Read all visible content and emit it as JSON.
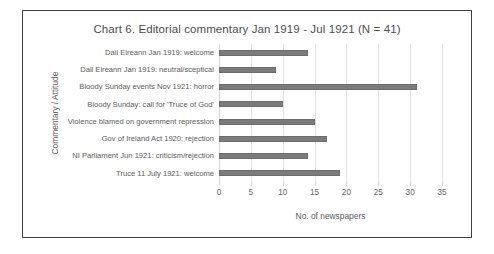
{
  "chart_data": {
    "type": "bar",
    "orientation": "horizontal",
    "title": "Chart 6. Editorial commentary Jan 1919 - Jul 1921 (N = 41)",
    "xlabel": "No. of newspapers",
    "ylabel": "Commentary / Attitude",
    "xlim": [
      0,
      35
    ],
    "xticks": [
      "0",
      "5",
      "10",
      "15",
      "20",
      "25",
      "30",
      "35"
    ],
    "grid": true,
    "legend": "none",
    "bar_color": "#7b7b7b",
    "categories": [
      "Dail Eireann Jan 1919: welcome",
      "Dail Eireann Jan 1919: neutral/sceptical",
      "Bloody Sunday events Nov 1921: horror",
      "Bloody Sunday: call for 'Truce of God'",
      "Violence blamed on government repression",
      "Gov of Ireland Act 1920: rejection",
      "NI Parliament Jun 1921: criticism/rejection",
      "Truce 11 July 1921: welcome"
    ],
    "values": [
      14,
      9,
      31,
      10,
      15,
      17,
      14,
      19
    ]
  }
}
